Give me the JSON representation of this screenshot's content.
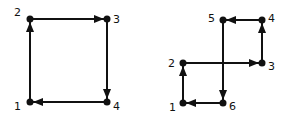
{
  "figures": [
    {
      "name": "square-cycle",
      "nodes": [
        {
          "id": "1",
          "x": 30,
          "y": 102,
          "lx": 14,
          "ly": 110
        },
        {
          "id": "2",
          "x": 30,
          "y": 19,
          "lx": 14,
          "ly": 16
        },
        {
          "id": "3",
          "x": 107,
          "y": 19,
          "lx": 113,
          "ly": 23
        },
        {
          "id": "4",
          "x": 107,
          "y": 102,
          "lx": 113,
          "ly": 110
        }
      ],
      "edges": [
        [
          "1",
          "2"
        ],
        [
          "2",
          "3"
        ],
        [
          "3",
          "4"
        ],
        [
          "4",
          "1"
        ]
      ]
    },
    {
      "name": "crossing-cycle",
      "nodes": [
        {
          "id": "1",
          "x": 183,
          "y": 103,
          "lx": 169,
          "ly": 111
        },
        {
          "id": "2",
          "x": 183,
          "y": 63,
          "lx": 168,
          "ly": 67
        },
        {
          "id": "3",
          "x": 262,
          "y": 63,
          "lx": 268,
          "ly": 70
        },
        {
          "id": "4",
          "x": 262,
          "y": 20,
          "lx": 268,
          "ly": 22
        },
        {
          "id": "5",
          "x": 223,
          "y": 20,
          "lx": 208,
          "ly": 22
        },
        {
          "id": "6",
          "x": 223,
          "y": 103,
          "lx": 229,
          "ly": 110
        }
      ],
      "edges": [
        [
          "1",
          "2"
        ],
        [
          "2",
          "3"
        ],
        [
          "3",
          "4"
        ],
        [
          "4",
          "5"
        ],
        [
          "5",
          "6"
        ],
        [
          "6",
          "1"
        ]
      ]
    }
  ],
  "colors": {
    "stroke": "#111111",
    "node": "#111111",
    "background": "#ffffff"
  }
}
